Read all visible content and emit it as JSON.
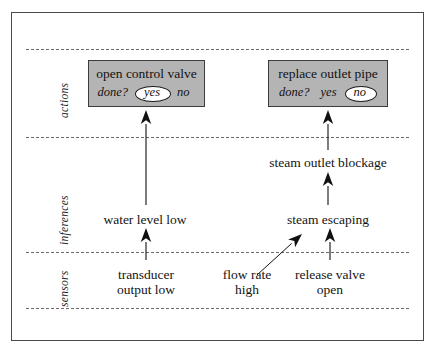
{
  "figure": {
    "frame": {
      "x": 11,
      "y": 12,
      "width": 413,
      "height": 329
    },
    "background_color": "#ffffff",
    "box_fill_color": "#b4b4b4",
    "line_color": "#6b6b6b"
  },
  "bands": [
    {
      "id": "actions",
      "label": "actions",
      "label_x": 58,
      "label_y": 118,
      "top_line_y": 49,
      "bottom_line_y": 137
    },
    {
      "id": "inferences",
      "label": "inferences",
      "label_x": 58,
      "label_y": 245,
      "top_line_y": 137,
      "bottom_line_y": 252
    },
    {
      "id": "sensors",
      "label": "sensors",
      "label_x": 58,
      "label_y": 307,
      "top_line_y": 252,
      "bottom_line_y": 308
    }
  ],
  "separators": [
    {
      "name": "separator-top",
      "y": 49,
      "x": 26,
      "width": 383
    },
    {
      "name": "separator-actions-inferences",
      "y": 137,
      "x": 26,
      "width": 383
    },
    {
      "name": "separator-inferences-sensors",
      "y": 252,
      "x": 26,
      "width": 383
    },
    {
      "name": "separator-bottom",
      "y": 308,
      "x": 26,
      "width": 383
    }
  ],
  "action_boxes": [
    {
      "id": "open-control-valve",
      "title": "open control valve",
      "done_label": "done?",
      "options": [
        {
          "label": "yes",
          "circled": true
        },
        {
          "label": "no",
          "circled": false
        }
      ],
      "x": 88,
      "y": 60,
      "width": 117,
      "height": 47
    },
    {
      "id": "replace-outlet-pipe",
      "title": "replace outlet pipe",
      "done_label": "done?",
      "options": [
        {
          "label": "yes",
          "circled": false
        },
        {
          "label": "no",
          "circled": true
        }
      ],
      "x": 268,
      "y": 60,
      "width": 120,
      "height": 47
    }
  ],
  "nodes": [
    {
      "id": "steam-outlet-blockage",
      "band": "inferences",
      "lines": [
        "steam outlet blockage"
      ],
      "cx": 328,
      "y": 155
    },
    {
      "id": "water-level-low",
      "band": "inferences",
      "lines": [
        "water level low"
      ],
      "cx": 145,
      "y": 212
    },
    {
      "id": "steam-escaping",
      "band": "inferences",
      "lines": [
        "steam escaping"
      ],
      "cx": 328,
      "y": 212
    },
    {
      "id": "transducer-output-low",
      "band": "sensors",
      "lines": [
        "transducer",
        "output low"
      ],
      "cx": 146,
      "y": 267
    },
    {
      "id": "flow-rate-high",
      "band": "sensors",
      "lines": [
        "flow rate",
        "high"
      ],
      "cx": 247,
      "y": 267
    },
    {
      "id": "release-valve-open",
      "band": "sensors",
      "lines": [
        "release valve",
        "open"
      ],
      "cx": 330,
      "y": 267
    }
  ],
  "arrows": [
    {
      "id": "arrow-water-level-low-to-open-control-valve",
      "from": "water-level-low",
      "to": "open-control-valve",
      "x1": 146,
      "y1": 205,
      "x2": 146,
      "y2": 110,
      "style": "straight"
    },
    {
      "id": "arrow-transducer-output-low-to-water-level-low",
      "from": "transducer-output-low",
      "to": "water-level-low",
      "x1": 146,
      "y1": 260,
      "x2": 146,
      "y2": 228,
      "style": "straight"
    },
    {
      "id": "arrow-steam-outlet-blockage-to-replace-outlet-pipe",
      "from": "steam-outlet-blockage",
      "to": "replace-outlet-pipe",
      "x1": 328,
      "y1": 150,
      "x2": 328,
      "y2": 110,
      "style": "straight"
    },
    {
      "id": "arrow-steam-escaping-to-steam-outlet-blockage",
      "from": "steam-escaping",
      "to": "steam-outlet-blockage",
      "x1": 328,
      "y1": 205,
      "x2": 328,
      "y2": 172,
      "style": "straight"
    },
    {
      "id": "arrow-release-valve-open-to-steam-escaping",
      "from": "release-valve-open",
      "to": "steam-escaping",
      "x1": 330,
      "y1": 260,
      "x2": 330,
      "y2": 228,
      "style": "straight"
    },
    {
      "id": "arrow-flow-rate-high-to-steam-escaping",
      "from": "flow-rate-high",
      "to": "steam-escaping",
      "x1": 257,
      "y1": 275,
      "x2": 302,
      "y2": 234,
      "style": "diagonal"
    }
  ]
}
